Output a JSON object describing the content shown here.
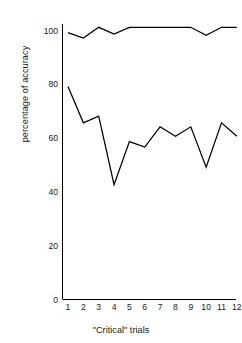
{
  "chart_data": {
    "type": "line",
    "title": "",
    "subtitle": "",
    "xlabel": "\"Critical\" trials",
    "ylabel": "percentage of accuracy",
    "x": [
      1,
      2,
      3,
      4,
      5,
      6,
      7,
      8,
      9,
      10,
      11,
      12
    ],
    "categories": [
      "1",
      "2",
      "3",
      "4",
      "5",
      "6",
      "7",
      "8",
      "9",
      "10",
      "11",
      "12"
    ],
    "xlim": [
      1,
      12
    ],
    "ylim": [
      0,
      105
    ],
    "yticks": [
      0,
      20,
      40,
      60,
      80,
      100
    ],
    "ytick_labels": [
      "0",
      "20",
      "40",
      "60",
      "80",
      "100"
    ],
    "xtick_labels": [
      "1",
      "2",
      "3",
      "4",
      "5",
      "6",
      "7",
      "8",
      "9",
      "10",
      "11",
      "12"
    ],
    "grid": false,
    "legend": "none",
    "axis_color": "#000000",
    "line_color": "#000000",
    "series": [
      {
        "name": "upper",
        "values": [
          99,
          97,
          101,
          98.5,
          101,
          101,
          101,
          101,
          101,
          98,
          101,
          101
        ]
      },
      {
        "name": "lower",
        "values": [
          79,
          65.5,
          68,
          42.5,
          58.5,
          56.5,
          64,
          60.5,
          64,
          49,
          65.5,
          60.5
        ]
      }
    ]
  },
  "axes": {
    "y_title": "percentage of accuracy",
    "x_title": "\"Critical\" trials",
    "y_ticks": [
      "100",
      "80",
      "60",
      "40",
      "20",
      "0"
    ],
    "x_ticks": [
      "1",
      "2",
      "3",
      "4",
      "5",
      "6",
      "7",
      "8",
      "9",
      "10",
      "11",
      "12"
    ]
  }
}
